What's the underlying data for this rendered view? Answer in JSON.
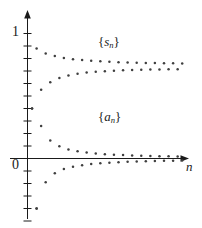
{
  "figure": {
    "background": "#ffffff",
    "ink_color": "#1a1a1a",
    "point_color": "#3f3f3f"
  },
  "axes": {
    "x_axis_label": "n",
    "y_tick_labels": [
      {
        "text": "1",
        "value": 1
      },
      {
        "text": "0",
        "value": 0
      }
    ],
    "origin_label": "0",
    "y_tick_count_above": 10,
    "y_tick_count_below": 6,
    "y_tick_step": 0.1
  },
  "series_labels": {
    "upper": {
      "open": "{",
      "symbol": "s",
      "subscript": "n",
      "close": "}"
    },
    "lower": {
      "open": "{",
      "symbol": "a",
      "subscript": "n",
      "close": "}"
    }
  },
  "chart_data": {
    "type": "scatter",
    "title": "",
    "subtitle": "",
    "xlabel": "n",
    "ylabel": "",
    "grid": false,
    "legend": "inline-annotation",
    "xlim": [
      0,
      35
    ],
    "ylim": [
      -0.5,
      1.08
    ],
    "annotations": [
      {
        "text": "{s_n}",
        "x": 15,
        "y": 0.98
      },
      {
        "text": "{a_n}",
        "x": 15,
        "y": 0.38
      }
    ],
    "series": [
      {
        "name": "{s_n}",
        "description": "Sequence of partial sums; alternating, converging to about 0.72",
        "marker": "dot",
        "x": [
          1,
          2,
          3,
          4,
          5,
          6,
          7,
          8,
          9,
          10,
          11,
          12,
          13,
          14,
          15,
          16,
          17,
          18,
          19,
          20,
          21,
          22,
          23,
          24,
          25,
          26,
          27,
          28,
          29,
          30,
          31,
          32,
          33,
          34
        ],
        "y": [
          0.4,
          0.88,
          0.55,
          0.84,
          0.61,
          0.82,
          0.645,
          0.805,
          0.665,
          0.795,
          0.678,
          0.788,
          0.688,
          0.783,
          0.694,
          0.778,
          0.699,
          0.774,
          0.703,
          0.771,
          0.706,
          0.769,
          0.708,
          0.767,
          0.71,
          0.765,
          0.712,
          0.764,
          0.713,
          0.763,
          0.714,
          0.762,
          0.715,
          0.761
        ]
      },
      {
        "name": "{a_n}",
        "description": "Terms of the sequence; alternating in sign, converging to 0",
        "marker": "dot",
        "x": [
          1,
          2,
          3,
          4,
          5,
          6,
          7,
          8,
          9,
          10,
          11,
          12,
          13,
          14,
          15,
          16,
          17,
          18,
          19,
          20,
          21,
          22,
          23,
          24,
          25,
          26,
          27,
          28,
          29,
          30,
          31,
          32,
          33,
          34
        ],
        "y": [
          0.4,
          -0.4,
          0.26,
          -0.19,
          0.145,
          -0.118,
          0.098,
          -0.084,
          0.073,
          -0.065,
          0.058,
          -0.053,
          0.048,
          -0.044,
          0.041,
          -0.038,
          0.035,
          -0.033,
          0.031,
          -0.029,
          0.028,
          -0.026,
          0.025,
          -0.024,
          0.023,
          -0.022,
          0.021,
          -0.02,
          0.019,
          -0.018,
          0.018,
          -0.017,
          0.016,
          -0.016
        ]
      },
      {
        "name": "outlier-first-term",
        "description": "Lowest isolated point below the axis near n=2",
        "marker": "dot",
        "x": [
          2
        ],
        "y": [
          -0.4
        ]
      }
    ]
  }
}
